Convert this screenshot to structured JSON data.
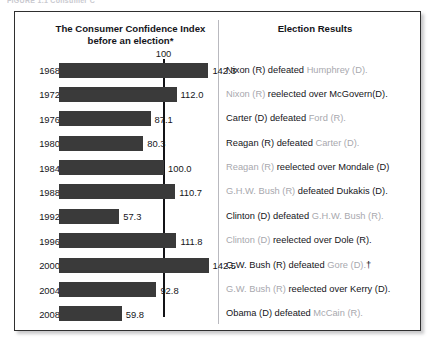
{
  "figure": {
    "caption_partial": "FIGURE 1.1   Consumer C",
    "frame_color": "#2f2f2f",
    "bar_color": "#3a3a3a",
    "loser_text_color": "#a8a8ae",
    "winner_text_color": "#15151a"
  },
  "headers": {
    "left": "The Consumer Confidence Index\nbefore an election*",
    "left_line1": "The Consumer Confidence Index",
    "left_line2": "before an election*",
    "right": "Election Results"
  },
  "reference": {
    "label": "100",
    "value": 100
  },
  "chart_data": {
    "type": "bar",
    "orientation": "horizontal",
    "title": "The Consumer Confidence Index before an election*",
    "xlabel": "",
    "ylabel": "",
    "categories": [
      "1968",
      "1972",
      "1976",
      "1980",
      "1984",
      "1988",
      "1992",
      "1996",
      "2000",
      "2004",
      "2008"
    ],
    "values": [
      142.3,
      112.0,
      87.1,
      80.3,
      100.0,
      110.7,
      57.3,
      111.8,
      142.5,
      92.8,
      59.8
    ],
    "value_labels": [
      "142.3",
      "112.0",
      "87.1",
      "80.3",
      "100.0",
      "110.7",
      "57.3",
      "111.8",
      "142.5",
      "92.8",
      "59.8"
    ],
    "reference_line": 100,
    "reference_line_label": "100",
    "xlim": [
      0,
      150
    ],
    "grid": false,
    "legend": null,
    "bar_color": "#3a3a3a"
  },
  "rows": [
    {
      "year": "1968",
      "value": 142.3,
      "value_label": "142.3",
      "result_parts": [
        {
          "text": "Nixon (R) defeated ",
          "role": "winner"
        },
        {
          "text": "Humphrey (D).",
          "role": "loser"
        }
      ]
    },
    {
      "year": "1972",
      "value": 112.0,
      "value_label": "112.0",
      "result_parts": [
        {
          "text": "Nixon (R) ",
          "role": "loser"
        },
        {
          "text": "reelected over McGovern(D).",
          "role": "winner"
        }
      ]
    },
    {
      "year": "1976",
      "value": 87.1,
      "value_label": "87.1",
      "result_parts": [
        {
          "text": "Carter (D) defeated ",
          "role": "winner"
        },
        {
          "text": "Ford (R).",
          "role": "loser"
        }
      ]
    },
    {
      "year": "1980",
      "value": 80.3,
      "value_label": "80.3",
      "result_parts": [
        {
          "text": "Reagan (R) defeated ",
          "role": "winner"
        },
        {
          "text": "Carter (D).",
          "role": "loser"
        }
      ]
    },
    {
      "year": "1984",
      "value": 100.0,
      "value_label": "100.0",
      "result_parts": [
        {
          "text": "Reagan (R) ",
          "role": "loser"
        },
        {
          "text": "reelected over Mondale (D)",
          "role": "winner"
        }
      ]
    },
    {
      "year": "1988",
      "value": 110.7,
      "value_label": "110.7",
      "result_parts": [
        {
          "text": "G.H.W. Bush (R) ",
          "role": "loser"
        },
        {
          "text": "defeated Dukakis (D).",
          "role": "winner"
        }
      ]
    },
    {
      "year": "1992",
      "value": 57.3,
      "value_label": "57.3",
      "result_parts": [
        {
          "text": "Clinton (D) defeated ",
          "role": "winner"
        },
        {
          "text": "G.H.W. Bush (R).",
          "role": "loser"
        }
      ]
    },
    {
      "year": "1996",
      "value": 111.8,
      "value_label": "111.8",
      "result_parts": [
        {
          "text": "Clinton (D) ",
          "role": "loser"
        },
        {
          "text": "reelected over Dole (R).",
          "role": "winner"
        }
      ]
    },
    {
      "year": "2000",
      "value": 142.5,
      "value_label": "142.5",
      "result_parts": [
        {
          "text": "G.W. Bush (R) defeated ",
          "role": "winner"
        },
        {
          "text": "Gore (D).",
          "role": "loser"
        },
        {
          "text": "†",
          "role": "dagger"
        }
      ]
    },
    {
      "year": "2004",
      "value": 92.8,
      "value_label": "92.8",
      "result_parts": [
        {
          "text": "G.W. Bush (R) ",
          "role": "loser"
        },
        {
          "text": "reelected over Kerry (D).",
          "role": "winner"
        }
      ]
    },
    {
      "year": "2008",
      "value": 59.8,
      "value_label": "59.8",
      "result_parts": [
        {
          "text": "Obama (D) defeated ",
          "role": "winner"
        },
        {
          "text": "McCain (R).",
          "role": "loser"
        }
      ]
    }
  ]
}
